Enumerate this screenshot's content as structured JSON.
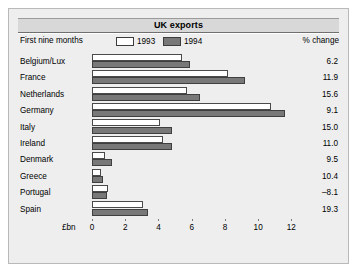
{
  "figure": {
    "title": "UK exports",
    "subtitle": "First nine months",
    "pct_column_header": "% change",
    "axis_unit": "£bn",
    "colors": {
      "panel_background": "#eeeeee",
      "title_bar": "#d8d8d8",
      "series_1993": "#ffffff",
      "series_1994": "#787878",
      "bar_outline": "#4a4a4a",
      "text": "#000000"
    }
  },
  "legend": [
    {
      "label": "1993",
      "swatch": "white-swatch"
    },
    {
      "label": "1994",
      "swatch": "grey-swatch"
    }
  ],
  "chart_data": {
    "type": "bar",
    "orientation": "horizontal",
    "title": "UK exports",
    "subtitle": "First nine months",
    "xlabel": "£bn",
    "ylabel": "",
    "xlim": [
      0,
      13
    ],
    "xticks": [
      0,
      2,
      4,
      6,
      8,
      10,
      12
    ],
    "xtick_labels": [
      "0",
      "2",
      "4",
      "6",
      "8",
      "10",
      "12"
    ],
    "grid": false,
    "legend_position": "top",
    "categories": [
      "Belgium/Lux",
      "France",
      "Netherlands",
      "Germany",
      "Italy",
      "Ireland",
      "Denmark",
      "Greece",
      "Portugal",
      "Spain"
    ],
    "series": [
      {
        "name": "1993",
        "values": [
          5.4,
          8.2,
          5.7,
          10.8,
          4.1,
          4.3,
          0.8,
          0.55,
          0.95,
          3.05
        ]
      },
      {
        "name": "1994",
        "values": [
          5.9,
          9.2,
          6.5,
          11.6,
          4.8,
          4.8,
          1.2,
          0.65,
          0.9,
          3.35
        ]
      }
    ],
    "annotations": {
      "column_header": "% change",
      "values": [
        6.2,
        11.9,
        15.6,
        9.1,
        15.0,
        11.0,
        9.5,
        10.4,
        -8.1,
        19.3
      ],
      "value_labels": [
        "6.2",
        "11.9",
        "15.6",
        "9.1",
        "15.0",
        "11.0",
        "9.5",
        "10.4",
        "–8.1",
        "19.3"
      ]
    }
  }
}
